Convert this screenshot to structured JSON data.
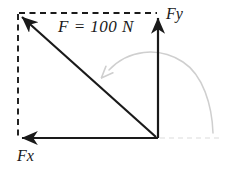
{
  "diagram": {
    "type": "force-vector-decomposition",
    "labels": {
      "resultant": "F = 100 N",
      "vertical_component": "Fy",
      "horizontal_component": "Fx"
    },
    "colors": {
      "vector_stroke": "#1a1a1a",
      "construction_dashed": "#1a1a1a",
      "faint_guide": "#d8d8d8",
      "rotation_arc": "#cfcfcf",
      "background": "#ffffff"
    },
    "geometry": {
      "origin": [
        157,
        138
      ],
      "top_left_corner": [
        18,
        13
      ],
      "vertical_arrow_tip": [
        158,
        14
      ],
      "horizontal_arrow_tip": [
        18,
        138
      ],
      "rotation_arrow_tip": [
        107,
        70
      ],
      "guide_line_end": [
        222,
        138
      ]
    },
    "values": {
      "magnitude": 100,
      "unit": "N"
    }
  }
}
